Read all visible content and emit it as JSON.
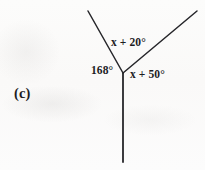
{
  "figure": {
    "part_label": "(c)",
    "background_color": "#fbfbfa",
    "stroke_color": "#26262a",
    "text_color": "#1d1d1f",
    "canvas": {
      "width": 205,
      "height": 170
    },
    "vertex": {
      "x": 123,
      "y": 73
    },
    "rays": [
      {
        "name": "upper-left-ray",
        "from": {
          "x": 123,
          "y": 73
        },
        "to": {
          "x": 88,
          "y": 11
        },
        "stroke_width": 1.5
      },
      {
        "name": "upper-right-ray",
        "from": {
          "x": 123,
          "y": 73
        },
        "to": {
          "x": 197,
          "y": 11
        },
        "stroke_width": 1.5
      },
      {
        "name": "downward-ray",
        "from": {
          "x": 123,
          "y": 73
        },
        "to": {
          "x": 123,
          "y": 162
        },
        "stroke_width": 1.8
      }
    ],
    "angle_labels": [
      {
        "name": "upper-angle-label",
        "text": "x + 20°",
        "expression": "x + 20",
        "unit": "degrees",
        "between_rays": [
          "upper-left-ray",
          "upper-right-ray"
        ]
      },
      {
        "name": "left-angle-label",
        "text": "168°",
        "value": 168,
        "unit": "degrees",
        "between_rays": [
          "upper-left-ray",
          "downward-ray"
        ]
      },
      {
        "name": "right-angle-label",
        "text": "x + 50°",
        "expression": "x + 50",
        "unit": "degrees",
        "between_rays": [
          "upper-right-ray",
          "downward-ray"
        ]
      }
    ]
  }
}
